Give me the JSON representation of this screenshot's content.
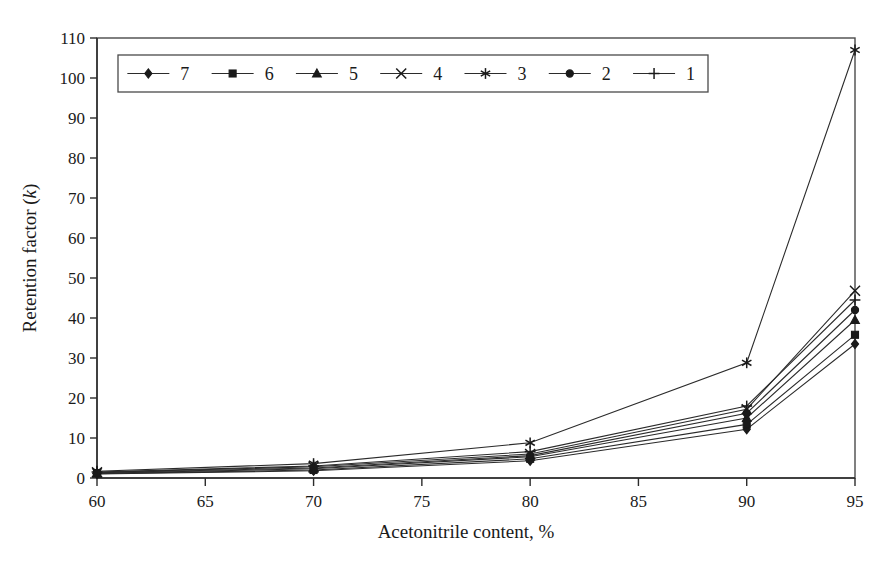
{
  "chart_data": {
    "type": "line",
    "title": "",
    "xlabel": "Acetonitrile content, %",
    "ylabel": "Retention factor (k)",
    "ylabel_parts": {
      "text": "Retention factor (",
      "italic": "k",
      "tail": ")"
    },
    "x": [
      60,
      70,
      80,
      90,
      95
    ],
    "xlim": [
      60,
      95
    ],
    "ylim": [
      0,
      110
    ],
    "xticks": [
      60,
      65,
      70,
      75,
      80,
      85,
      90,
      95
    ],
    "yticks": [
      0,
      10,
      20,
      30,
      40,
      50,
      60,
      70,
      80,
      90,
      100,
      110
    ],
    "grid": false,
    "legend_position": "top-left-inside",
    "series": [
      {
        "name": "7",
        "marker": "diamond",
        "values": [
          1.0,
          1.8,
          4.3,
          12.2,
          33.5
        ]
      },
      {
        "name": "6",
        "marker": "square",
        "values": [
          1.1,
          2.0,
          4.8,
          13.4,
          35.8
        ]
      },
      {
        "name": "5",
        "marker": "triangle",
        "values": [
          1.2,
          2.3,
          5.3,
          15.0,
          39.5
        ]
      },
      {
        "name": "4",
        "marker": "x",
        "values": [
          1.4,
          2.8,
          6.0,
          17.2,
          46.8
        ]
      },
      {
        "name": "3",
        "marker": "asterisk",
        "values": [
          1.7,
          3.6,
          8.8,
          28.8,
          107.0
        ]
      },
      {
        "name": "2",
        "marker": "circle",
        "values": [
          1.3,
          2.5,
          5.6,
          16.2,
          42.0
        ]
      },
      {
        "name": "1",
        "marker": "plus",
        "values": [
          1.5,
          3.0,
          6.6,
          18.0,
          44.5
        ]
      }
    ]
  },
  "legend": {
    "entries": [
      {
        "label": "7",
        "marker": "diamond"
      },
      {
        "label": "6",
        "marker": "square"
      },
      {
        "label": "5",
        "marker": "triangle"
      },
      {
        "label": "4",
        "marker": "x"
      },
      {
        "label": "3",
        "marker": "asterisk"
      },
      {
        "label": "2",
        "marker": "circle"
      },
      {
        "label": "1",
        "marker": "plus"
      }
    ]
  },
  "colors": {
    "ink": "#1a1a1a",
    "axis": "#2b2b2b",
    "frame": "#4a4a4a",
    "background": "#ffffff"
  }
}
